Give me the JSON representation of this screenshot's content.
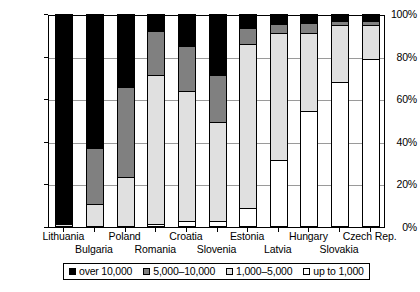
{
  "chart_data": {
    "type": "bar",
    "subtype": "stacked-percentage",
    "title": "",
    "xlabel": "",
    "ylabel": "",
    "ylim": [
      0,
      100
    ],
    "yunit": "%",
    "grid": true,
    "legend_position": "bottom",
    "categories": [
      "Lithuania",
      "Bulgaria",
      "Poland",
      "Romania",
      "Croatia",
      "Slovenia",
      "Estonia",
      "Latvia",
      "Hungary",
      "Slovakia",
      "Czech Rep."
    ],
    "ytick_labels": [
      "0%",
      "20%",
      "40%",
      "60%",
      "80%",
      "100%"
    ],
    "ytick_values": [
      0,
      20,
      40,
      60,
      80,
      100
    ],
    "series": [
      {
        "name": "over 10,000",
        "color": "#000000",
        "values": [
          98.5,
          63.0,
          34.5,
          8.0,
          15.0,
          28.5,
          6.5,
          4.5,
          4.0,
          3.5,
          3.5
        ]
      },
      {
        "name": "5,000–10,000",
        "color": "#808080",
        "values": [
          0.0,
          26.0,
          42.0,
          20.5,
          21.0,
          22.0,
          7.5,
          4.5,
          5.0,
          1.5,
          1.5
        ]
      },
      {
        "name": "1,000–5,000",
        "color": "#e0e0e0",
        "values": [
          1.5,
          11.0,
          23.5,
          70.0,
          61.3,
          46.5,
          77.0,
          59.5,
          36.5,
          27.0,
          16.0
        ]
      },
      {
        "name": "up to 1,000",
        "color": "#ffffff",
        "values": [
          0.0,
          0.0,
          0.0,
          1.5,
          2.7,
          3.0,
          9.0,
          31.5,
          54.5,
          68.0,
          79.0
        ]
      }
    ],
    "stack_order_bottom_to_top": [
      "up to 1,000",
      "1,000–5,000",
      "5,000–10,000",
      "over 10,000"
    ]
  },
  "legend": {
    "items": [
      {
        "label": "over 10,000",
        "color": "#000000"
      },
      {
        "label": "5,000–10,000",
        "color": "#808080"
      },
      {
        "label": "1,000–5,000",
        "color": "#e0e0e0"
      },
      {
        "label": "up to 1,000",
        "color": "#ffffff"
      }
    ]
  }
}
